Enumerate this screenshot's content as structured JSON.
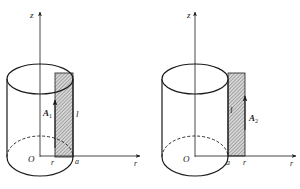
{
  "figures": [
    {
      "id": "left",
      "axis_z_label": "z",
      "axis_r_label": "r",
      "origin_label": "O",
      "tick_labels": [
        "r",
        "a"
      ],
      "vector_label": "A",
      "vector_subscript": "1",
      "length_label": "l",
      "description": "Rectangular loop inside cylinder (r < a)"
    },
    {
      "id": "right",
      "axis_z_label": "z",
      "axis_r_label": "r",
      "origin_label": "O",
      "tick_labels": [
        "a",
        "r"
      ],
      "vector_label": "A",
      "vector_subscript": "2",
      "length_label": "l",
      "description": "Rectangular loop outside cylinder (r > a)"
    }
  ],
  "colors": {
    "stroke": "#1a1a1a",
    "hatch": "#555555",
    "hatch_bg": "#d8d8d8"
  }
}
